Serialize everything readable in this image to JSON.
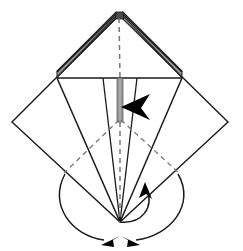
{
  "figure": {
    "title": "Origami fold diagram",
    "type": "origami-step-diagram",
    "canvas": {
      "width": 243,
      "height": 251,
      "background": "#ffffff"
    },
    "colors": {
      "outline": "#1a1a1a",
      "crease_dashed": "#6e6e6e",
      "shaded_fill": "#9a9a9a",
      "shaded_edge": "#2a2a2a",
      "arrow_solid": "#000000",
      "paper_white": "#ffffff"
    },
    "key_points": {
      "apex_top": {
        "x": 119,
        "y": 15
      },
      "left_diamond": {
        "x": 12,
        "y": 122
      },
      "right_diamond": {
        "x": 228,
        "y": 122
      },
      "bottom_converge": {
        "x": 120,
        "y": 222
      },
      "horizontal_left": {
        "x": 57,
        "y": 78
      },
      "horizontal_right": {
        "x": 182,
        "y": 78
      },
      "center_mid": {
        "x": 120,
        "y": 122
      },
      "dash_left_end": {
        "x": 65,
        "y": 172
      },
      "dash_right_end": {
        "x": 178,
        "y": 172
      }
    }
  },
  "shapes": {
    "outer_diamond": {
      "label": "outer square rotated 45 degrees",
      "points": "119,15 228,122 120,222 12,122"
    },
    "inner_horizontal_band": {
      "label": "horizontal crease line",
      "x1": 57,
      "y1": 78,
      "x2": 182,
      "y2": 78
    },
    "shaded_left_flap": {
      "label": "gray shaded left flap strip",
      "points": "119,15 57,78 57,72 117,13"
    },
    "shaded_right_flap": {
      "label": "gray shaded right flap strip",
      "points": "120,15 182,78 182,72 122,13"
    },
    "center_shaded_strip": {
      "label": "vertical shaded center strip",
      "x": 117,
      "y": 78,
      "w": 6,
      "h": 44
    }
  },
  "creases": [
    {
      "name": "center-vertical-dashed",
      "x1": 119,
      "y1": 18,
      "x2": 120,
      "y2": 78,
      "style": "dashed"
    },
    {
      "name": "center-vertical-lower-dashed",
      "x1": 120,
      "y1": 122,
      "x2": 120,
      "y2": 222,
      "style": "dashed"
    },
    {
      "name": "diagonal-dashed-left",
      "x1": 120,
      "y1": 120,
      "x2": 65,
      "y2": 172,
      "style": "dashed"
    },
    {
      "name": "diagonal-dashed-right",
      "x1": 120,
      "y1": 120,
      "x2": 178,
      "y2": 172,
      "style": "dashed"
    },
    {
      "name": "solid-left-flap-edge",
      "x1": 57,
      "y1": 78,
      "x2": 120,
      "y2": 222,
      "style": "solid"
    },
    {
      "name": "solid-right-flap-edge",
      "x1": 182,
      "y1": 78,
      "x2": 120,
      "y2": 222,
      "style": "solid"
    },
    {
      "name": "solid-left-inner-edge",
      "x1": 103,
      "y1": 78,
      "x2": 120,
      "y2": 222,
      "style": "solid"
    },
    {
      "name": "solid-right-inner-edge",
      "x1": 137,
      "y1": 78,
      "x2": 120,
      "y2": 222,
      "style": "solid"
    }
  ],
  "arrows": [
    {
      "name": "center-fold-arrow",
      "direction": "left",
      "description": "solid black arrowhead pointing left at centre of model",
      "tip": {
        "x": 122,
        "y": 107
      }
    },
    {
      "name": "right-curl-arrow",
      "direction": "up",
      "description": "small arrowhead pointing up-left on right arc",
      "tip": {
        "x": 145,
        "y": 183
      }
    },
    {
      "name": "bottom-left-arrow",
      "direction": "down-left",
      "description": "arrowhead at end of left swing arc",
      "tip": {
        "x": 103,
        "y": 244
      }
    },
    {
      "name": "bottom-right-arrow",
      "direction": "down-right",
      "description": "arrowhead at end of right swing arc",
      "tip": {
        "x": 137,
        "y": 244
      }
    }
  ],
  "arcs": [
    {
      "name": "left-swing-arc",
      "from": {
        "x": 65,
        "y": 174
      },
      "to": {
        "x": 106,
        "y": 241
      }
    },
    {
      "name": "right-swing-arc",
      "from": {
        "x": 178,
        "y": 174
      },
      "to": {
        "x": 134,
        "y": 241
      }
    },
    {
      "name": "inner-curl-arc",
      "from": {
        "x": 120,
        "y": 222
      },
      "to": {
        "x": 146,
        "y": 186
      }
    }
  ]
}
